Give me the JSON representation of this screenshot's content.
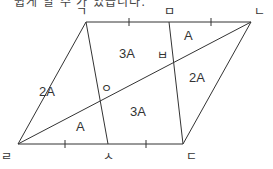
{
  "caption": "쉽게 알 수 가 있습니다.",
  "figure": {
    "vertex_labels": {
      "giyeok": "ㄱ",
      "mieum": "ㅁ",
      "nieun": "ㄴ",
      "rieul": "ㄹ",
      "siot": "ㅅ",
      "digeut": "ㄷ",
      "ieung": "ㅇ",
      "bieup": "ㅂ"
    },
    "region_labels": {
      "top_middle": "3A",
      "top_right_small": "A",
      "left": "2A",
      "right": "2A",
      "bottom_left_small": "A",
      "bottom_middle": "3A"
    }
  }
}
